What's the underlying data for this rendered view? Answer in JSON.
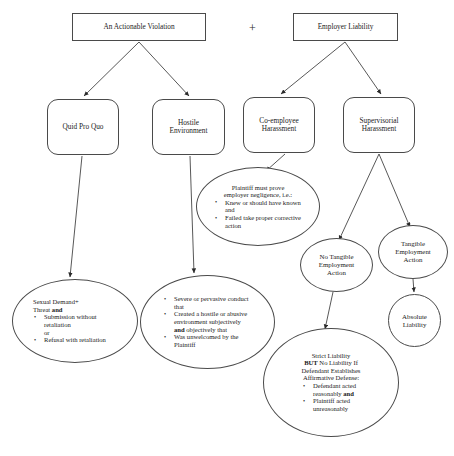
{
  "diagram": {
    "operator": "+",
    "nodes": {
      "violation": {
        "label": "An Actionable Violation",
        "shape": "rectangle"
      },
      "employer": {
        "label": "Employer Liability",
        "shape": "rectangle"
      },
      "quid_pro_quo": {
        "label": "Quid Pro Quo",
        "shape": "rounded-rectangle"
      },
      "hostile": {
        "line1": "Hostile",
        "line2": "Environment",
        "shape": "rounded-rectangle"
      },
      "coemployee": {
        "line1": "Co-employee",
        "line2": "Harassment",
        "shape": "rounded-rectangle"
      },
      "supervisorial": {
        "line1": "Supervisorial",
        "line2": "Harassment",
        "shape": "rounded-rectangle"
      },
      "negligence": {
        "shape": "ellipse",
        "lead_line1": "Plaintiff must prove",
        "lead_line2": "employer negligence, i.e.:",
        "bullets": [
          "Knew or should have known and",
          "Failed take proper corrective action"
        ]
      },
      "no_tangible": {
        "line1": "No Tangible",
        "line2": "Employment",
        "line3": "Action",
        "shape": "ellipse"
      },
      "tangible": {
        "line1": "Tangible",
        "line2": "Employment",
        "line3": "Action",
        "shape": "ellipse"
      },
      "absolute": {
        "line1": "Absolute",
        "line2": "Liability",
        "shape": "ellipse"
      },
      "sexual_demand": {
        "shape": "ellipse",
        "lead_line1": "Sexual Demand+",
        "lead_line2_pre": "Threat ",
        "lead_line2_bold": "and",
        "bullets": [
          "Submission without retaliation",
          "or",
          "Refusal with retaliation"
        ]
      },
      "severe": {
        "shape": "ellipse",
        "bullet1": "Severe or pervasive conduct that",
        "bullet2_pre": "Created a hostile or abusive environment subjectively ",
        "bullet2_bold": "and",
        "bullet2_post": " objectively that",
        "bullet3": "Was unwelcomed by the Plaintiff"
      },
      "strict_liability": {
        "shape": "ellipse",
        "lead_line1": "Strict Liability",
        "lead_line2_bold": "BUT",
        "lead_line2_post": " No Liability If",
        "lead_line3": "Defendant Establishes",
        "lead_line4": "Affirmative Defense:",
        "bullet1_pre": "Defendant acted reasonably ",
        "bullet1_bold": "and",
        "bullet2": "Plaintiff acted unreasonably"
      }
    },
    "colors": {
      "stroke": "#4a4a4a",
      "edge": "#3a3a3a",
      "text": "#1a1a1a",
      "background": "#ffffff"
    }
  }
}
